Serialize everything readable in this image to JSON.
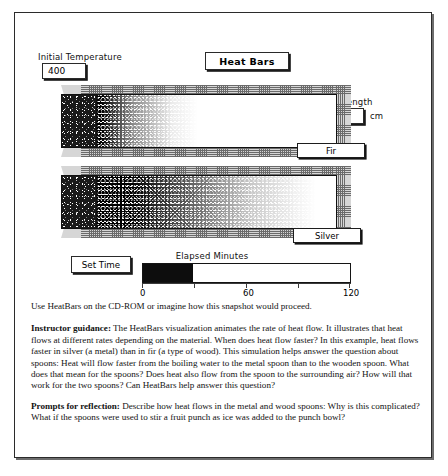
{
  "simulation": {
    "title": "Heat Bars",
    "initial_temperature": {
      "label": "Initial Temperature",
      "value": "400"
    },
    "bar_length": {
      "label": "Bar Length",
      "value": "20",
      "unit": "cm"
    },
    "bars": [
      {
        "name": "Fir",
        "material": "fir",
        "heat_front_percent": 46
      },
      {
        "name": "Silver",
        "material": "silver",
        "heat_front_percent": 92
      }
    ],
    "time": {
      "set_time_label": "Set Time",
      "elapsed_label": "Elapsed Minutes",
      "elapsed_value": 29,
      "min": 0,
      "max": 120,
      "fill_percent": 24,
      "ticks": [
        "0",
        "60",
        "120"
      ]
    }
  },
  "text": {
    "lead": "Use HeatBars on the CD-ROM or imagine how this snapshot would proceed.",
    "guidance_heading": "Instructor guidance:",
    "guidance_body": "The HeatBars visualization animates the rate of heat flow. It illustrates that heat flows at different rates depending on the material.  When does heat flow faster?  In this example, heat flows faster in silver (a metal) than in fir (a type of wood).  This simulation helps answer the question about spoons:  Heat will flow faster from the boiling water to the metal spoon than to the wooden spoon.  What does that mean for the spoons?  Does heat also flow from the spoon to the surrounding air?  How will that work for the two spoons?  Can HeatBars help answer this question?",
    "prompts_heading": "Prompts for reflection:",
    "prompts_body": "Describe how heat flows in the metal and wood spoons:  Why is this complicated?  What if the spoons were used to stir a fruit punch as ice was added to the punch bowl?"
  }
}
